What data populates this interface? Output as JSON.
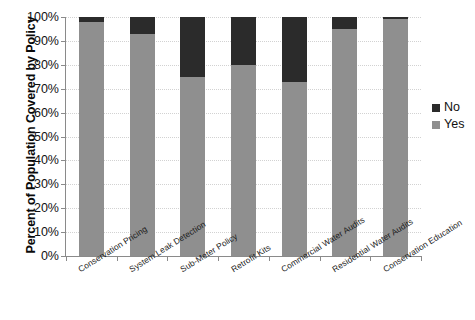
{
  "chart_data": {
    "type": "bar",
    "stacked": true,
    "title": "",
    "xlabel": "",
    "ylabel": "Percent of Population Covered by Policy",
    "ylim": [
      0,
      100
    ],
    "yticks": [
      "0%",
      "10%",
      "20%",
      "30%",
      "40%",
      "50%",
      "60%",
      "70%",
      "80%",
      "90%",
      "100%"
    ],
    "ytick_values": [
      0,
      10,
      20,
      30,
      40,
      50,
      60,
      70,
      80,
      90,
      100
    ],
    "grid": true,
    "legend_position": "right",
    "categories": [
      "Conservation Pricing",
      "System Leak Detection",
      "Sub-Meter Policy",
      "Retrofit Kits",
      "Commercial Water Audits",
      "Residential Water Audits",
      "Conservation Education"
    ],
    "series": [
      {
        "name": "Yes",
        "color": "#8f8f8f",
        "values": [
          98,
          93,
          75,
          80,
          73,
          95,
          99
        ]
      },
      {
        "name": "No",
        "color": "#2b2b2b",
        "values": [
          2,
          7,
          25,
          20,
          27,
          5,
          1
        ]
      }
    ]
  },
  "legend": {
    "entries": [
      {
        "label": "No",
        "color": "#2b2b2b"
      },
      {
        "label": "Yes",
        "color": "#8f8f8f"
      }
    ]
  }
}
